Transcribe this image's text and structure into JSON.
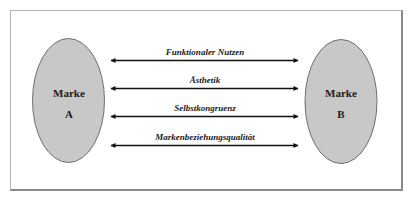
{
  "diagram": {
    "brand_a": {
      "line1": "Marke",
      "line2": "A"
    },
    "brand_b": {
      "line1": "Marke",
      "line2": "B"
    },
    "relations": [
      {
        "label": "Funktionaler Nutzen"
      },
      {
        "label": "Ästhetik"
      },
      {
        "label": "Selbstkongruenz"
      },
      {
        "label": "Markenbeziehungsqualität"
      }
    ],
    "colors": {
      "ellipse_fill": "#c8c8c8",
      "ellipse_stroke": "#6e6e6e",
      "arrow": "#111111",
      "frame": "#8a8a8a"
    }
  }
}
